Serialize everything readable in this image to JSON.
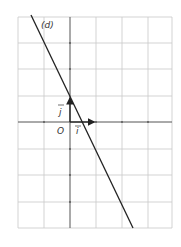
{
  "figure": {
    "line_label": "(d)",
    "origin_label": "O",
    "vector_i_label": "i",
    "vector_j_label": "j",
    "colors": {
      "grid": "#c8c8c8",
      "axis": "#555555",
      "line": "#222222",
      "text": "#333333"
    },
    "grid": {
      "x_range": [
        -2,
        4
      ],
      "y_range": [
        -4,
        4
      ],
      "unit_px": 26.3
    },
    "line_equation": "y = -2x + 1"
  }
}
